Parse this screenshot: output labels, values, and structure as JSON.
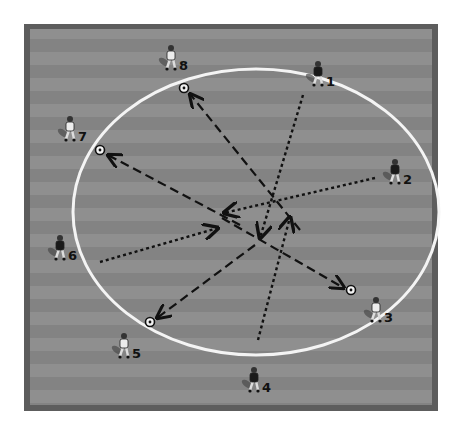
{
  "diagram": {
    "type": "soccer-passing-drill",
    "field": {
      "x": 24,
      "y": 24,
      "width": 414,
      "height": 387,
      "border_color": "#5a5a5a",
      "stripe_light": "#8e8e8e",
      "stripe_dark": "#828282"
    },
    "circle": {
      "cx": 256,
      "cy": 212,
      "rx": 183,
      "ry": 143,
      "color": "#f4f4f4"
    },
    "players": [
      {
        "id": "1",
        "label": "1",
        "x": 318,
        "y": 72,
        "shirt": "dark"
      },
      {
        "id": "2",
        "label": "2",
        "x": 395,
        "y": 170,
        "shirt": "dark"
      },
      {
        "id": "3",
        "label": "3",
        "x": 376,
        "y": 308,
        "shirt": "light"
      },
      {
        "id": "4",
        "label": "4",
        "x": 254,
        "y": 378,
        "shirt": "dark"
      },
      {
        "id": "5",
        "label": "5",
        "x": 124,
        "y": 344,
        "shirt": "light"
      },
      {
        "id": "6",
        "label": "6",
        "x": 60,
        "y": 246,
        "shirt": "dark"
      },
      {
        "id": "7",
        "label": "7",
        "x": 70,
        "y": 127,
        "shirt": "light"
      },
      {
        "id": "8",
        "label": "8",
        "x": 171,
        "y": 56,
        "shirt": "light"
      }
    ],
    "balls": [
      {
        "near": "8",
        "x": 184,
        "y": 88
      },
      {
        "near": "7",
        "x": 100,
        "y": 150
      },
      {
        "near": "5",
        "x": 150,
        "y": 322
      },
      {
        "near": "3",
        "x": 351,
        "y": 290
      }
    ],
    "dashed_passes": [
      {
        "from": [
          300,
          230
        ],
        "to": [
          190,
          94
        ],
        "desc": "pass to ball near 8"
      },
      {
        "from": [
          240,
          225
        ],
        "to": [
          108,
          155
        ],
        "desc": "pass to ball near 7"
      },
      {
        "from": [
          255,
          245
        ],
        "to": [
          157,
          318
        ],
        "desc": "pass to ball near 5"
      },
      {
        "from": [
          222,
          218
        ],
        "to": [
          344,
          288
        ],
        "desc": "pass to ball near 3"
      }
    ],
    "dotted_runs": [
      {
        "from": [
          303,
          95
        ],
        "to": [
          260,
          238
        ],
        "player": "1"
      },
      {
        "from": [
          375,
          178
        ],
        "to": [
          224,
          213
        ],
        "player": "2"
      },
      {
        "from": [
          100,
          262
        ],
        "to": [
          218,
          228
        ],
        "player": "6"
      },
      {
        "from": [
          258,
          340
        ],
        "to": [
          290,
          217
        ],
        "player": "4"
      }
    ]
  }
}
